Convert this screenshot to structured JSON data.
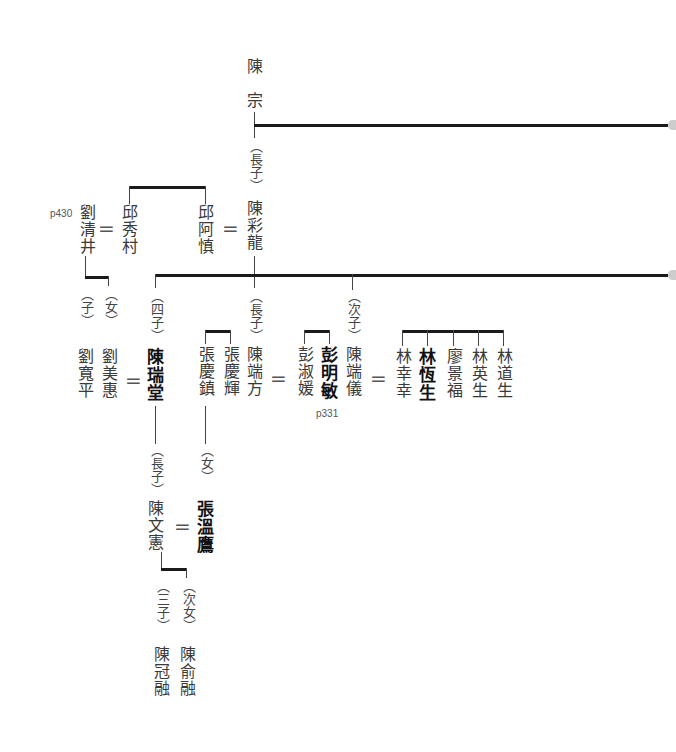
{
  "root": {
    "surname": "陳",
    "given": "宗"
  },
  "gen1": {
    "relation": "（長子）",
    "name": "陳彩龍",
    "spouse": "邱阿慎",
    "spouse_sibling": "邱秀村",
    "spouse_sibling_spouse": "劉清井",
    "page_ref": "p430"
  },
  "liu_children": [
    {
      "relation": "（子）",
      "name": "劉寬平"
    },
    {
      "relation": "（女）",
      "name": "劉美惠"
    }
  ],
  "gen2": [
    {
      "relation": "（四子）",
      "name": "陳瑞堂",
      "spouse": "劉美惠"
    },
    {
      "relation": "（長子）",
      "name": "陳端方",
      "spouse": "彭淑媛"
    },
    {
      "relation": "（次子）",
      "name": "陳端儀",
      "spouse": "林幸幸"
    }
  ],
  "zhang": {
    "brothers": [
      "張慶鎮",
      "張慶輝"
    ]
  },
  "peng": {
    "siblings": [
      "彭淑媛",
      "彭明敏"
    ],
    "page_ref": "p331"
  },
  "lin_group": [
    "林幸幸",
    "林恆生",
    "廖景福",
    "林英生",
    "林道生"
  ],
  "gen3": {
    "relation": "（長子）",
    "name": "陳文憲",
    "spouse_relation": "（女）",
    "spouse": "張溫鷹"
  },
  "gen4": [
    {
      "relation": "（三子）",
      "name": "陳冠融"
    },
    {
      "relation": "（次女）",
      "name": "陳俞融"
    }
  ],
  "symbols": {
    "marriage": "="
  },
  "colors": {
    "line": "#1a1a1a",
    "text": "#3a3a3a",
    "bold_text": "#111111"
  }
}
